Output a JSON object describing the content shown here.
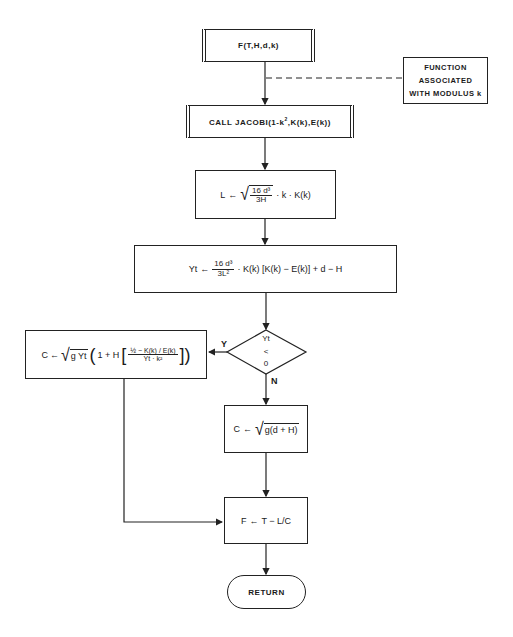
{
  "diagram": {
    "type": "flowchart",
    "nodes": {
      "entry": {
        "label": "F(T,H,d,k)",
        "shape": "predefined-process"
      },
      "annotation": {
        "lines": [
          "FUNCTION",
          "ASSOCIATED",
          "WITH MODULUS k"
        ]
      },
      "call_jacobi": {
        "label": "CALL JACOBI(1-k², K(k), E(k))",
        "prefix": "CALL JACOBI(1-k",
        "sup": "2",
        "suffix": ",K(k),E(k))",
        "shape": "predefined-process"
      },
      "compute_L": {
        "lhs": "L",
        "arrow": "←",
        "num": "16 d³",
        "den": "3H",
        "tail": "· k · K(k)",
        "text": "L ← √(16d³/3H) · k · K(k)"
      },
      "compute_Yt": {
        "lhs": "Yt",
        "arrow": "←",
        "num": "16 d³",
        "den": "3L²",
        "tail": "· K(k) [K(k) − E(k)] + d − H",
        "text": "Yt ← (16d³/3L²) · K(k)[K(k) − E(k)] + d − H"
      },
      "decision": {
        "top": "Yt",
        "mid": "<",
        "bottom": "0",
        "text": "Yt < 0",
        "yes_label": "Y",
        "no_label": "N"
      },
      "compute_C_yes": {
        "lhs": "C",
        "arrow": "←",
        "sqrt_content": "g Yt",
        "inner_prefix": "1 + H",
        "num": "½ − K(k) / E(k)",
        "den": "Yt · k²",
        "text": "C ← √(g Yt) (1 + H[(½ − K(k)/E(k)) / (Yt · k²)])"
      },
      "compute_C_no": {
        "lhs": "C",
        "arrow": "←",
        "sqrt_content": "g(d + H)",
        "text": "C ← √(g(d + H))"
      },
      "compute_F": {
        "lhs": "F",
        "arrow": "←",
        "rhs": "T − L/C",
        "text": "F ← T − L/C"
      },
      "return": {
        "label": "RETURN",
        "shape": "terminal"
      }
    },
    "edges": [
      {
        "from": "entry",
        "to": "call_jacobi"
      },
      {
        "from": "call_jacobi",
        "to": "compute_L"
      },
      {
        "from": "compute_L",
        "to": "compute_Yt"
      },
      {
        "from": "compute_Yt",
        "to": "decision"
      },
      {
        "from": "decision",
        "to": "compute_C_yes",
        "label": "Y"
      },
      {
        "from": "decision",
        "to": "compute_C_no",
        "label": "N"
      },
      {
        "from": "compute_C_yes",
        "to": "compute_F"
      },
      {
        "from": "compute_C_no",
        "to": "compute_F"
      },
      {
        "from": "compute_F",
        "to": "return"
      },
      {
        "from": "annotation",
        "to": "entry-edge",
        "style": "dashed"
      }
    ]
  }
}
